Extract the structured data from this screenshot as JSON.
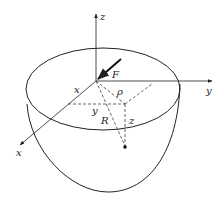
{
  "diagram": {
    "labels": {
      "z_axis": "z",
      "y_axis": "y",
      "x_axis": "x",
      "force": "F",
      "x_coord": "x",
      "y_coord": "y",
      "rho": "ρ",
      "R": "R",
      "z_coord": "z"
    },
    "colors": {
      "line": "#222222",
      "background": "#ffffff"
    }
  }
}
